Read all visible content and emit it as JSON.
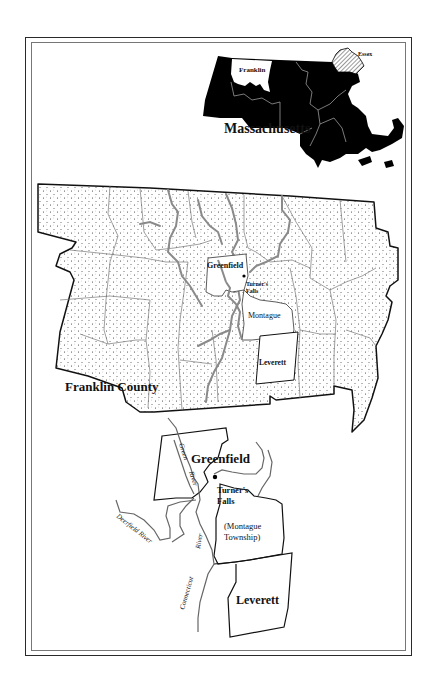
{
  "state_map": {
    "title": "Massachusetts",
    "highlighted_counties": [
      {
        "name": "Franklin",
        "style": "white"
      },
      {
        "name": "Essex",
        "style": "hatched"
      }
    ],
    "fill_color": "#000000"
  },
  "county_map": {
    "title": "Franklin County",
    "towns": [
      {
        "name": "Greenfield",
        "style": "white"
      },
      {
        "name": "Montague",
        "style": "white"
      },
      {
        "name": "Leverett",
        "style": "white"
      }
    ],
    "places": [
      {
        "name_line1": "Turner's",
        "name_line2": "Falls",
        "marker": "dot"
      }
    ],
    "fill_pattern": "stippled"
  },
  "detail_map": {
    "towns": {
      "greenfield": "Greenfield",
      "montague_line1": "(Montague",
      "montague_line2": "Township)",
      "leverett": "Leverett"
    },
    "places": {
      "turners_falls_line1": "Turner's",
      "turners_falls_line2": "Falls"
    },
    "rivers": {
      "green_line1": "Green",
      "green_line2": "River",
      "deerfield": "Deerfield River",
      "connecticut_line1": "Connecticut",
      "connecticut_line2": "River"
    }
  }
}
